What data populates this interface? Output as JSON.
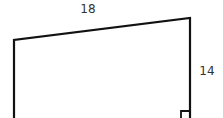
{
  "diagram": {
    "type": "trapezoid",
    "labels": {
      "top_side": "18",
      "right_side": "14"
    },
    "stroke_color": "#111111",
    "text_color": "#333333",
    "right_angle_marker": "bottom-right"
  }
}
